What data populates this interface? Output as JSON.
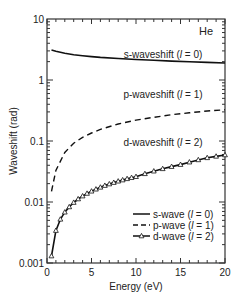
{
  "chart_data": {
    "type": "line",
    "title": "",
    "annotation_element": "He",
    "xlabel": "Energy (eV)",
    "ylabel": "Waveshift (rad)",
    "xlim": [
      0,
      20
    ],
    "ylim": [
      0.001,
      10
    ],
    "yscale": "log",
    "xticks": [
      0,
      5,
      10,
      15,
      20
    ],
    "xtick_labels": [
      "0",
      "5",
      "10",
      "15",
      "20"
    ],
    "yticks": [
      0.001,
      0.01,
      0.1,
      1,
      10
    ],
    "ytick_labels": [
      "0.001",
      "0.01",
      "0.1",
      "1",
      "10"
    ],
    "grid": false,
    "legend_position": "lower right",
    "curve_labels": [
      {
        "text": "s-waveshift (l = 0)",
        "prefix": "s-waveshift (",
        "var": "l",
        "suffix": " = 0)"
      },
      {
        "text": "p-waveshift (l = 1)",
        "prefix": "p-waveshift (",
        "var": "l",
        "suffix": " = 1)"
      },
      {
        "text": "d-waveshift (l = 2)",
        "prefix": "d-waveshift (",
        "var": "l",
        "suffix": " = 2)"
      }
    ],
    "series": [
      {
        "name": "s-wave (l = 0)",
        "style": "solid",
        "marker": "none",
        "x": [
          0.5,
          1,
          2,
          3,
          4,
          5,
          6,
          8,
          10,
          12,
          14,
          16,
          18,
          20
        ],
        "y": [
          3.1,
          2.95,
          2.75,
          2.6,
          2.5,
          2.42,
          2.35,
          2.25,
          2.17,
          2.1,
          2.04,
          1.99,
          1.94,
          1.9
        ]
      },
      {
        "name": "p-wave (l = 1)",
        "style": "dashed",
        "marker": "none",
        "x": [
          0.5,
          1,
          2,
          3,
          4,
          5,
          6,
          8,
          10,
          12,
          14,
          16,
          18,
          20
        ],
        "y": [
          0.015,
          0.033,
          0.065,
          0.092,
          0.115,
          0.135,
          0.155,
          0.19,
          0.22,
          0.245,
          0.27,
          0.29,
          0.31,
          0.325
        ]
      },
      {
        "name": "d-wave (l = 2)",
        "style": "solid",
        "marker": "triangle",
        "x": [
          0.5,
          1,
          1.5,
          2,
          2.5,
          3,
          3.5,
          4,
          4.5,
          5,
          5.5,
          6,
          6.5,
          7,
          7.5,
          8,
          8.5,
          9,
          9.5,
          10,
          11,
          12,
          13,
          14,
          15,
          16,
          17,
          18,
          19,
          20
        ],
        "y": [
          0.0013,
          0.0034,
          0.0052,
          0.0068,
          0.0083,
          0.0098,
          0.0112,
          0.0125,
          0.0138,
          0.015,
          0.0162,
          0.0174,
          0.0186,
          0.0197,
          0.0208,
          0.0219,
          0.0229,
          0.024,
          0.025,
          0.026,
          0.029,
          0.032,
          0.035,
          0.038,
          0.041,
          0.045,
          0.049,
          0.053,
          0.056,
          0.059
        ]
      }
    ],
    "legend": [
      {
        "label": "s-wave (l = 0)",
        "prefix": "s-wave (",
        "var": "l",
        "suffix": " = 0)",
        "style": "solid",
        "marker": "none"
      },
      {
        "label": "p-wave (l = 1)",
        "prefix": "p-wave (",
        "var": "l",
        "suffix": " = 1)",
        "style": "dashed",
        "marker": "none"
      },
      {
        "label": "d-wave (l = 2)",
        "prefix": "d-wave (",
        "var": "l",
        "suffix": " = 2)",
        "style": "solid",
        "marker": "triangle"
      }
    ]
  }
}
